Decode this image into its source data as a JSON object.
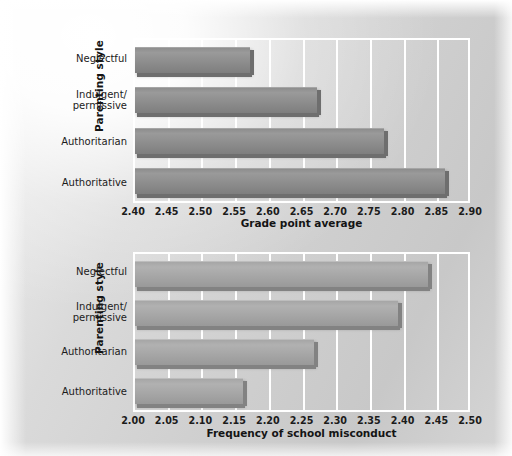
{
  "figure": {
    "background_color": "#cfcfcf",
    "gridline_color": "#ffffff"
  },
  "chart_data": [
    {
      "id": "grade-point-average",
      "type": "bar",
      "orientation": "horizontal",
      "title": "",
      "xlabel": "Grade point average",
      "ylabel": "Parenting style",
      "xlim": [
        2.4,
        2.9
      ],
      "xticks": [
        "2.40",
        "2.45",
        "2.50",
        "2.55",
        "2.60",
        "2.65",
        "2.70",
        "2.75",
        "2.80",
        "2.85",
        "2.90"
      ],
      "grid": true,
      "legend": "none",
      "bar_color": "#8d8d8d",
      "categories": [
        "Neglectful",
        "Indulgent/ permissive",
        "Authoritarian",
        "Authoritative"
      ],
      "category_lines": [
        [
          "Neglectful"
        ],
        [
          "Indulgent/",
          "permissive"
        ],
        [
          "Authoritarian"
        ],
        [
          "Authoritative"
        ]
      ],
      "values": [
        2.57,
        2.67,
        2.77,
        2.86
      ]
    },
    {
      "id": "frequency-of-school-misconduct",
      "type": "bar",
      "orientation": "horizontal",
      "title": "",
      "xlabel": "Frequency of school misconduct",
      "ylabel": "Parenting style",
      "xlim": [
        2.0,
        2.5
      ],
      "xticks": [
        "2.00",
        "2.05",
        "2.10",
        "2.15",
        "2.20",
        "2.25",
        "2.30",
        "2.35",
        "2.40",
        "2.45",
        "2.50"
      ],
      "grid": true,
      "legend": "none",
      "bar_color": "#a6a6a6",
      "categories": [
        "Neglectful",
        "Indulgent/ permissive",
        "Authoritarian",
        "Authoritative"
      ],
      "category_lines": [
        [
          "Neglectful"
        ],
        [
          "Indulgent/",
          "permissive"
        ],
        [
          "Authoritarian"
        ],
        [
          "Authoritative"
        ]
      ],
      "values": [
        2.435,
        2.39,
        2.265,
        2.16
      ]
    }
  ]
}
